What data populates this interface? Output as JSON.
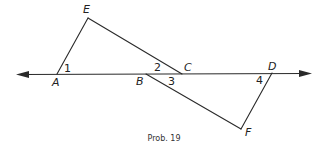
{
  "diagram": {
    "caption": "Prob. 19",
    "points": {
      "A": {
        "label": "A",
        "x": 57,
        "y": 74
      },
      "B": {
        "label": "B",
        "x": 146,
        "y": 74
      },
      "C": {
        "label": "C",
        "x": 182,
        "y": 74
      },
      "D": {
        "label": "D",
        "x": 272,
        "y": 73
      },
      "E": {
        "label": "E",
        "x": 88,
        "y": 18
      },
      "F": {
        "label": "F",
        "x": 241,
        "y": 129
      }
    },
    "angles": [
      {
        "label": "1",
        "at": "A"
      },
      {
        "label": "2",
        "at": "C"
      },
      {
        "label": "3",
        "at": "B"
      },
      {
        "label": "4",
        "at": "D"
      }
    ],
    "segments": [
      "AE",
      "EC",
      "BF",
      "FD"
    ],
    "line": {
      "through": [
        "A",
        "B",
        "C",
        "D"
      ],
      "arrows": "both"
    },
    "stroke_color": "#2a2a2a"
  }
}
